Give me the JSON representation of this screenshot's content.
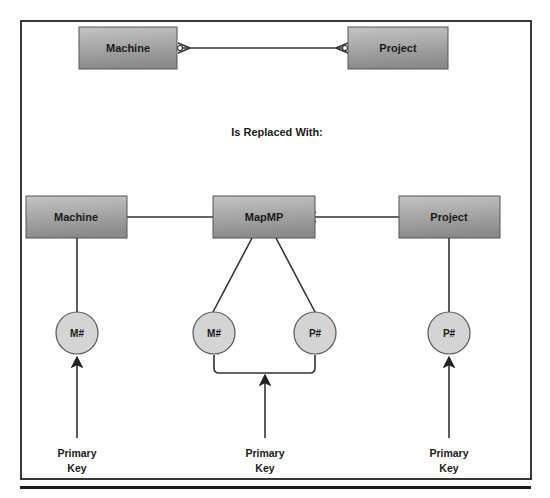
{
  "diagram": {
    "type": "entity-relationship",
    "top": {
      "left_entity": "Machine",
      "right_entity": "Project",
      "relationship": "many-to-many"
    },
    "heading": "Is Replaced With:",
    "bottom": {
      "entities": [
        {
          "id": "machine",
          "label": "Machine"
        },
        {
          "id": "mapmp",
          "label": "MapMP"
        },
        {
          "id": "project",
          "label": "Project"
        }
      ],
      "attributes": [
        {
          "entity": "machine",
          "label": "M#"
        },
        {
          "entity": "mapmp",
          "label": "M#"
        },
        {
          "entity": "mapmp",
          "label": "P#"
        },
        {
          "entity": "project",
          "label": "P#"
        }
      ],
      "key_labels": [
        {
          "line1": "Primary",
          "line2": "Key"
        },
        {
          "line1": "Primary",
          "line2": "Key"
        },
        {
          "line1": "Primary",
          "line2": "Key"
        }
      ]
    },
    "colors": {
      "box_gradient_top": "#c8c8c8",
      "box_gradient_bottom": "#8e8e8e",
      "circle_fill": "#d4d4d4",
      "line": "#333333"
    }
  }
}
